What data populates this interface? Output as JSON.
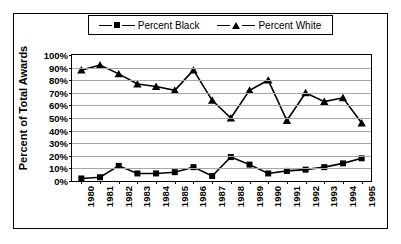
{
  "chart_data": {
    "type": "line",
    "title": "",
    "xlabel": "",
    "ylabel": "Percent of Total Awards",
    "ylim": [
      0,
      100
    ],
    "ytick_labels": [
      "100%",
      "90%",
      "80%",
      "70%",
      "60%",
      "50%",
      "40%",
      "30%",
      "20%",
      "10%",
      "0%"
    ],
    "ytick_values": [
      100,
      90,
      80,
      70,
      60,
      50,
      40,
      30,
      20,
      10,
      0
    ],
    "grid": true,
    "legend_position": "top-center",
    "categories": [
      "1980",
      "1981",
      "1982",
      "1983",
      "1984",
      "1985",
      "1986",
      "1987",
      "1988",
      "1989",
      "1990",
      "1991",
      "1992",
      "1993",
      "1994",
      "1995"
    ],
    "series": [
      {
        "name": "Percent Black",
        "marker": "square",
        "color": "#000000",
        "values": [
          2,
          3,
          12,
          6,
          6,
          7,
          11,
          4,
          19,
          13,
          6,
          8,
          9,
          11,
          14,
          18
        ]
      },
      {
        "name": "Percent White",
        "marker": "triangle",
        "color": "#000000",
        "values": [
          88,
          92,
          85,
          77,
          75,
          72,
          88,
          64,
          50,
          72,
          80,
          48,
          70,
          63,
          66,
          46
        ]
      }
    ]
  },
  "legend": {
    "entries": [
      {
        "label": "Percent Black",
        "marker": "square-marker"
      },
      {
        "label": "Percent White",
        "marker": "triangle-marker"
      }
    ]
  },
  "axes": {
    "y_title": "Percent of Total Awards"
  }
}
